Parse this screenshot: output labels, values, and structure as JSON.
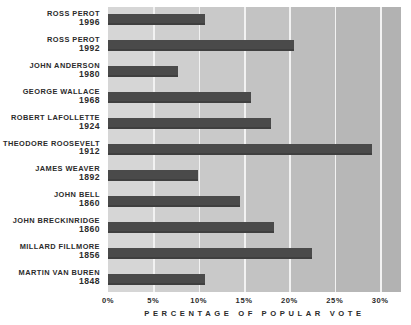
{
  "chart_data": {
    "type": "bar",
    "orientation": "horizontal",
    "title": "",
    "xlabel": "PERCENTAGE OF POPULAR VOTE",
    "ylabel": "",
    "xlim": [
      0,
      32.3
    ],
    "grid": true,
    "legend": null,
    "xticks": [
      0,
      5,
      10,
      15,
      20,
      25,
      30
    ],
    "xticklabels": [
      "0%",
      "5%",
      "10%",
      "15%",
      "20%",
      "25%",
      "30%"
    ],
    "categories": [
      "ROSS PEROT 1996",
      "ROSS PEROT 1992",
      "JOHN ANDERSON 1980",
      "GEORGE WALLACE 1968",
      "ROBERT LaFOLLETTE 1924",
      "THEODORE ROOSEVELT 1912",
      "JAMES WEAVER 1892",
      "JOHN BELL 1860",
      "JOHN BRECKINRIDGE 1860",
      "MILLARD FILLMORE 1856",
      "MARTIN VAN BUREN 1848"
    ],
    "values": [
      10.7,
      20.5,
      7.7,
      15.8,
      18.0,
      29.1,
      9.9,
      14.5,
      18.3,
      22.5,
      10.7
    ],
    "bar_color": "#4a4a4a",
    "plot_background": "#c9c9c9",
    "gridline_color": "#f2f2f2"
  },
  "bars": [
    {
      "name": "ROSS PEROT",
      "year": "1996",
      "value": 10.7
    },
    {
      "name": "ROSS PEROT",
      "year": "1992",
      "value": 20.5
    },
    {
      "name": "JOHN ANDERSON",
      "year": "1980",
      "value": 7.7
    },
    {
      "name": "GEORGE WALLACE",
      "year": "1968",
      "value": 15.8
    },
    {
      "name": "ROBERT LaFOLLETTE",
      "year": "1924",
      "value": 18.0
    },
    {
      "name": "THEODORE ROOSEVELT",
      "year": "1912",
      "value": 29.1
    },
    {
      "name": "JAMES WEAVER",
      "year": "1892",
      "value": 9.9
    },
    {
      "name": "JOHN BELL",
      "year": "1860",
      "value": 14.5
    },
    {
      "name": "JOHN BRECKINRIDGE",
      "year": "1860",
      "value": 18.3
    },
    {
      "name": "MILLARD FILLMORE",
      "year": "1856",
      "value": 22.5
    },
    {
      "name": "MARTIN VAN BUREN",
      "year": "1848",
      "value": 10.7
    }
  ],
  "axis": {
    "ticks": [
      "0%",
      "5%",
      "10%",
      "15%",
      "20%",
      "25%",
      "30%"
    ],
    "title": "PERCENTAGE OF POPULAR VOTE"
  }
}
